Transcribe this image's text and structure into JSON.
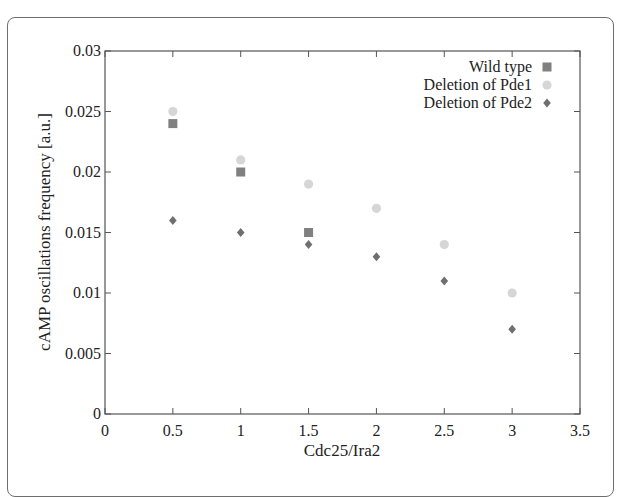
{
  "chart_data": {
    "type": "scatter",
    "title": "",
    "xlabel": "Cdc25/Ira2",
    "ylabel": "cAMP oscillations frequency [a.u.]",
    "xlim": [
      0,
      3.5
    ],
    "ylim": [
      0,
      0.03
    ],
    "xticks": [
      "0",
      "0.5",
      "1",
      "1.5",
      "2",
      "2.5",
      "3",
      "3.5"
    ],
    "yticks": [
      "0",
      "0.005",
      "0.01",
      "0.015",
      "0.02",
      "0.025",
      "0.03"
    ],
    "grid": false,
    "legend_position": "top-right",
    "series": [
      {
        "name": "Wild type",
        "marker": "square",
        "color": "#808080",
        "x": [
          0.5,
          1,
          1.5
        ],
        "y": [
          0.024,
          0.02,
          0.015
        ]
      },
      {
        "name": "Deletion of Pde1",
        "marker": "circle",
        "color": "#d6d6d6",
        "x": [
          0.5,
          1,
          1.5,
          2,
          2.5,
          3
        ],
        "y": [
          0.025,
          0.021,
          0.019,
          0.017,
          0.014,
          0.01
        ]
      },
      {
        "name": "Deletion of Pde2",
        "marker": "diamond",
        "color": "#6f6f6f",
        "x": [
          0.5,
          1,
          1.5,
          2,
          2.5,
          3
        ],
        "y": [
          0.016,
          0.015,
          0.014,
          0.013,
          0.011,
          0.007
        ]
      }
    ]
  }
}
